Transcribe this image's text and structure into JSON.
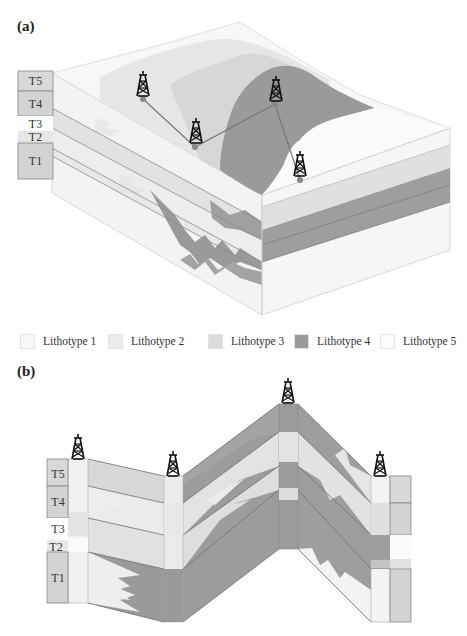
{
  "figure": {
    "panel_a": {
      "label": "(a)",
      "units": [
        {
          "name": "T5",
          "fill": "#d9d9d9"
        },
        {
          "name": "T4",
          "fill": "#d3d3d3"
        },
        {
          "name": "T3",
          "fill": "#ffffff"
        },
        {
          "name": "T2",
          "fill": "#e6e6e6"
        },
        {
          "name": "T1",
          "fill": "#d3d3d3"
        }
      ],
      "wells": 4
    },
    "legend": [
      {
        "label": "Lithotype 1",
        "color": "#f7f7f7"
      },
      {
        "label": "Lithotype 2",
        "color": "#ebebeb"
      },
      {
        "label": "Lithotype 3",
        "color": "#dcdcdc"
      },
      {
        "label": "Lithotype 4",
        "color": "#9a9a9a"
      },
      {
        "label": "Lithotype 5",
        "color": "#fdfdfd"
      }
    ],
    "panel_b": {
      "label": "(b)",
      "units": [
        {
          "name": "T5"
        },
        {
          "name": "T4"
        },
        {
          "name": "T3"
        },
        {
          "name": "T2"
        },
        {
          "name": "T1"
        }
      ],
      "wells": 4
    }
  }
}
